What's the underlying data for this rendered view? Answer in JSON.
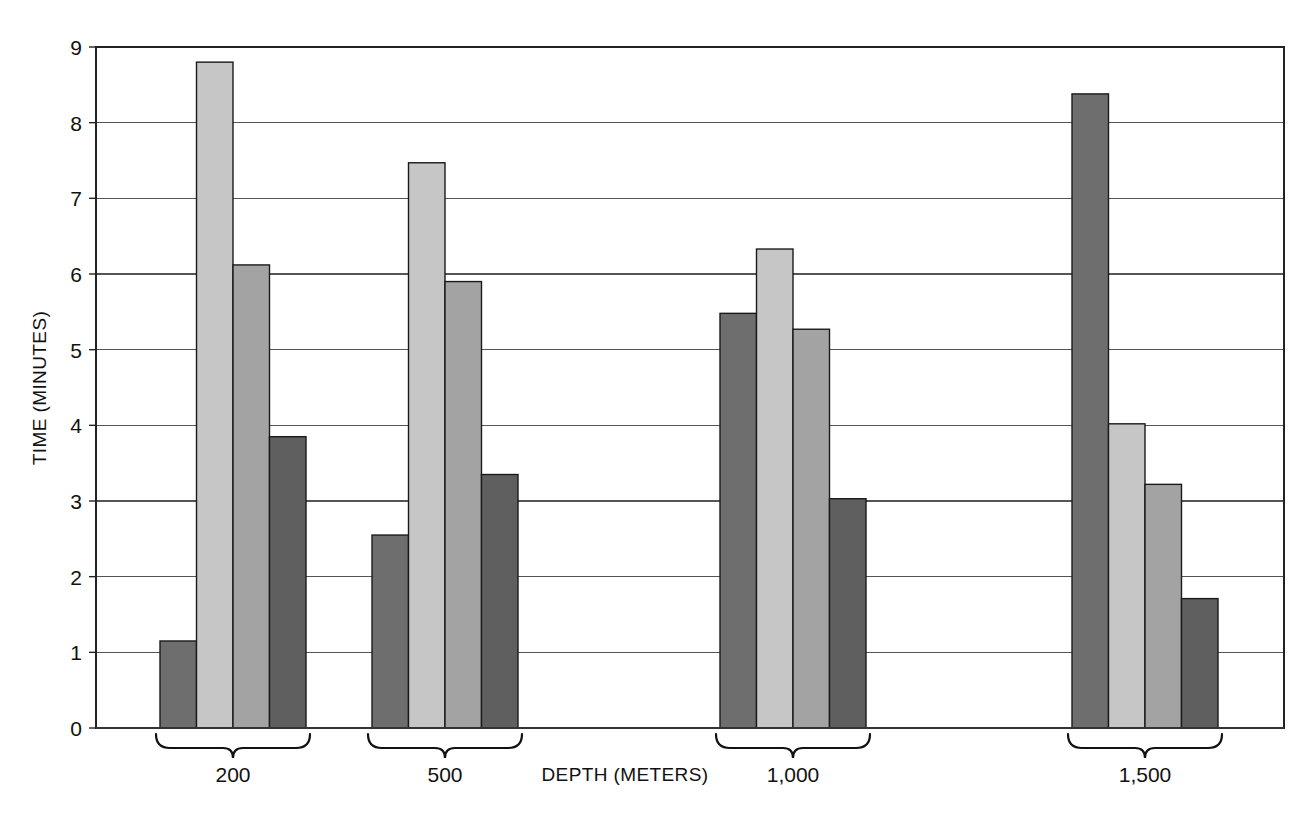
{
  "chart_data": {
    "type": "bar",
    "title": "",
    "subtitle": "",
    "xlabel": "DEPTH (METERS)",
    "ylabel": "TIME (MINUTES)",
    "categories": [
      "200",
      "500",
      "1,000",
      "1,500"
    ],
    "ylim": [
      0,
      9
    ],
    "xlim_note": "categorical, 4 groups of 4 bars",
    "y_ticks": [
      "0",
      "1",
      "2",
      "3",
      "4",
      "5",
      "6",
      "7",
      "8",
      "9"
    ],
    "y_tick_values": [
      0,
      1,
      2,
      3,
      4,
      5,
      6,
      7,
      8,
      9
    ],
    "grid": "horizontal gridlines at every integer tick",
    "legend": "none",
    "annotations": [],
    "series": [
      {
        "name": "series-1",
        "color": "#6e6e6e",
        "values": [
          1.15,
          2.55,
          5.48,
          8.38
        ]
      },
      {
        "name": "series-2",
        "color": "#c6c6c6",
        "values": [
          8.8,
          7.47,
          6.33,
          4.02
        ]
      },
      {
        "name": "series-3",
        "color": "#a3a3a3",
        "values": [
          6.12,
          5.9,
          5.27,
          3.22
        ]
      },
      {
        "name": "series-4",
        "color": "#5f5f5f",
        "values": [
          3.85,
          3.35,
          3.03,
          1.71
        ]
      }
    ]
  },
  "axes": {
    "y_axis_title": "TIME (MINUTES)",
    "x_axis_title": "DEPTH (METERS)"
  },
  "ticks": {
    "y": [
      "9",
      "8",
      "7",
      "6",
      "5",
      "4",
      "3",
      "2",
      "1",
      "0"
    ]
  },
  "groups": [
    {
      "label": "200"
    },
    {
      "label": "500"
    },
    {
      "label": "1,000"
    },
    {
      "label": "1,500"
    }
  ],
  "colors": {
    "series_1": "#6e6e6e",
    "series_2": "#c6c6c6",
    "series_3": "#a3a3a3",
    "series_4": "#5f5f5f",
    "grid": "#555555",
    "frame": "#222222",
    "text": "#111111",
    "background": "#ffffff"
  }
}
